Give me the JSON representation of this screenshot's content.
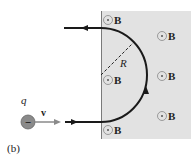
{
  "figure": {
    "panel_label": "(b)",
    "charge": {
      "label": "q",
      "sign": "−",
      "color": "#8a8a8a"
    },
    "velocity": {
      "label": "v",
      "arrow_color": "#8a8a8a"
    },
    "radius_label": "R",
    "field": {
      "label": "B",
      "direction": "out-of-page",
      "region_color": "#e2e2e2",
      "markers": [
        {
          "x": 108,
          "y": 20
        },
        {
          "x": 108,
          "y": 80
        },
        {
          "x": 108,
          "y": 130
        },
        {
          "x": 162,
          "y": 36
        },
        {
          "x": 162,
          "y": 76
        },
        {
          "x": 162,
          "y": 116
        }
      ]
    },
    "path_color": "#1a1a1a"
  }
}
